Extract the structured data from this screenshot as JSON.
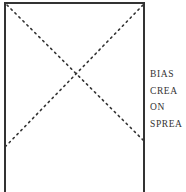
{
  "figure": {
    "type": "placeholder-box-with-x",
    "border_color": "#333333",
    "line_style": "dotted",
    "labels": [
      "BIAS",
      "CREA",
      "ON",
      "SPREA"
    ]
  }
}
